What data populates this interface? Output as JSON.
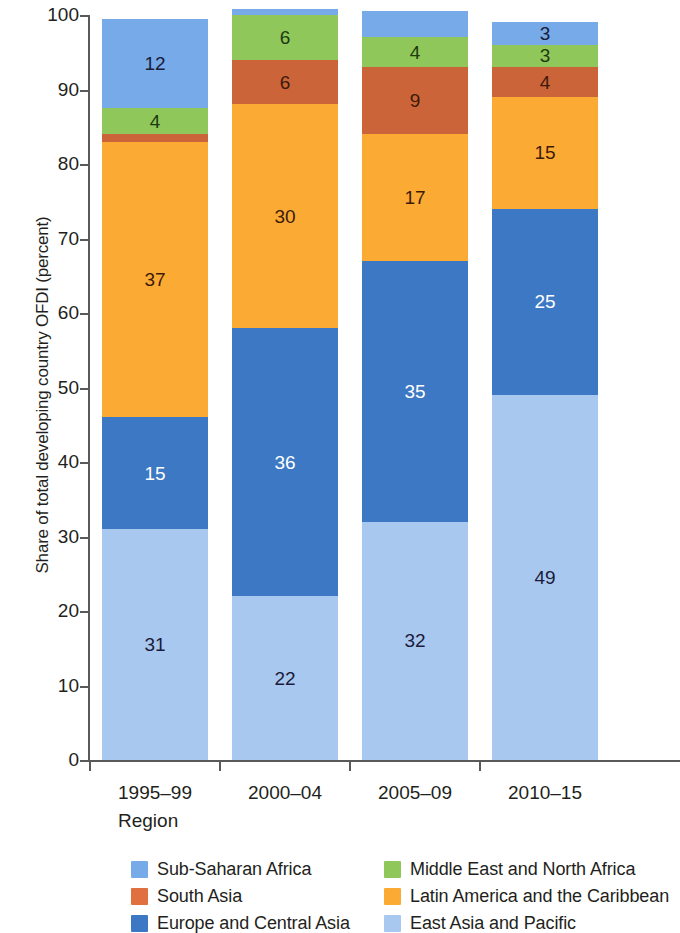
{
  "chart_data": {
    "type": "bar",
    "stacked": true,
    "title": "",
    "xlabel": "Region",
    "ylabel": "Share of total developing country OFDI (percent)",
    "ylim": [
      0,
      100
    ],
    "yticks": [
      0,
      10,
      20,
      30,
      40,
      50,
      60,
      70,
      80,
      90,
      100
    ],
    "grid": false,
    "legend_position": "bottom",
    "categories": [
      "1995–99",
      "2000–04",
      "2005–09",
      "2010–15"
    ],
    "series": [
      {
        "name": "East Asia and Pacific",
        "color": "#a8c8ef",
        "values": [
          31,
          22,
          32,
          49
        ],
        "labels": [
          "31",
          "22",
          "32",
          "49"
        ],
        "label_color": [
          "dark",
          "dark",
          "dark",
          "dark"
        ]
      },
      {
        "name": "Europe and Central Asia",
        "color": "#3d78c4",
        "values": [
          15,
          36,
          35,
          25
        ],
        "labels": [
          "15",
          "36",
          "35",
          "25"
        ],
        "label_color": [
          "light",
          "light",
          "light",
          "light"
        ]
      },
      {
        "name": "Latin America and the Caribbean",
        "color": "#fbab33",
        "values": [
          37,
          30,
          17,
          15
        ],
        "labels": [
          "37",
          "30",
          "17",
          "15"
        ],
        "label_color": [
          "brown",
          "brown",
          "brown",
          "brown"
        ]
      },
      {
        "name": "South Asia",
        "color": "#cc6439",
        "values": [
          1,
          6,
          9,
          4
        ],
        "labels": [
          "",
          "6",
          "9",
          "4"
        ],
        "label_color": [
          "brown",
          "brown",
          "brown",
          "brown"
        ]
      },
      {
        "name": "Middle East and North Africa",
        "color": "#8fc75a",
        "values": [
          3.5,
          6,
          4,
          3
        ],
        "labels": [
          "4",
          "6",
          "4",
          "3"
        ],
        "label_color": [
          "green",
          "green",
          "green",
          "green"
        ]
      },
      {
        "name": "Sub-Saharan Africa",
        "color": "#76aae8",
        "values": [
          12,
          0.8,
          3.5,
          3
        ],
        "labels": [
          "12",
          "",
          "",
          "3"
        ],
        "label_color": [
          "dark",
          "dark",
          "dark",
          "dark"
        ]
      }
    ],
    "totals": [
      99.5,
      100.8,
      100.5,
      99
    ]
  },
  "axes": {
    "ytick_labels": [
      "0",
      "10",
      "20",
      "30",
      "40",
      "50",
      "60",
      "70",
      "80",
      "90",
      "100"
    ],
    "xtick_labels": [
      "1995–99",
      "2000–04",
      "2005–09",
      "2010–15"
    ],
    "xaxis_title": "Region",
    "yaxis_title": "Share of total developing country OFDI (percent)"
  },
  "legend": {
    "entries": [
      {
        "label": "Sub-Saharan Africa",
        "color": "#76aae8"
      },
      {
        "label": "Middle East and North Africa",
        "color": "#8fc75a"
      },
      {
        "label": "South Asia",
        "color": "#e0703f"
      },
      {
        "label": "Latin America and the Caribbean",
        "color": "#fbab33"
      },
      {
        "label": "Europe and Central Asia",
        "color": "#3d78c4"
      },
      {
        "label": "East Asia and Pacific",
        "color": "#a8c8ef"
      }
    ]
  }
}
